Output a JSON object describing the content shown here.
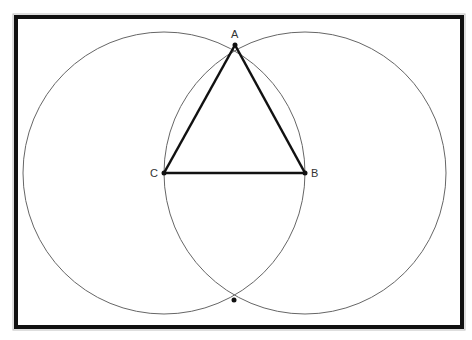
{
  "diagram": {
    "type": "geometric-construction",
    "points": [
      {
        "label": "A",
        "x": 235,
        "y": 45
      },
      {
        "label": "B",
        "x": 305,
        "y": 173
      },
      {
        "label": "C",
        "x": 164,
        "y": 173
      },
      {
        "label": "",
        "x": 234,
        "y": 300
      }
    ],
    "circles": [
      {
        "center": "C",
        "cx": 164,
        "cy": 173,
        "r": 141
      },
      {
        "center": "B",
        "cx": 305,
        "cy": 173,
        "r": 141
      }
    ],
    "segments": [
      [
        "A",
        "B"
      ],
      [
        "B",
        "C"
      ],
      [
        "C",
        "A"
      ]
    ],
    "colors": {
      "frame": "#111111",
      "circle": "#666666",
      "triangle": "#111111",
      "background": "#ffffff"
    }
  }
}
